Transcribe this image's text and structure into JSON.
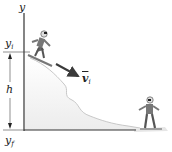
{
  "diagram": {
    "axis_label": "y",
    "labels": {
      "y_initial": "y",
      "y_initial_sub": "i",
      "height": "h",
      "y_final": "y",
      "y_final_sub": "f",
      "velocity": "v",
      "velocity_sub": "i"
    },
    "colors": {
      "axis": "#333333",
      "slope_edge": "#bdbdbd",
      "slope_fill": "#f2f2f2",
      "arrow": "#3a3a3a",
      "figure": "#6b6b6b"
    }
  }
}
